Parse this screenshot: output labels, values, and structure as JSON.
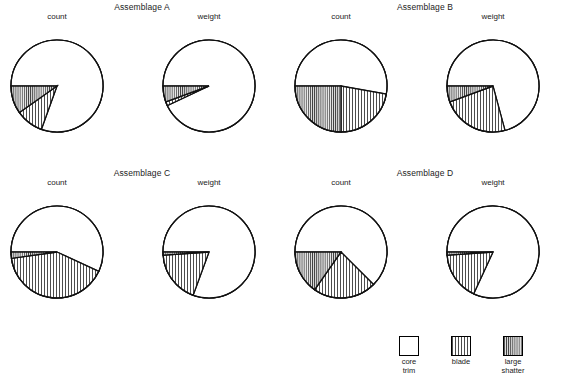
{
  "figure": {
    "background": "#ffffff",
    "stroke_color": "#000000",
    "panels": [
      {
        "title": "Assemblage A",
        "charts": [
          "count",
          "weight"
        ]
      },
      {
        "title": "Assemblage B",
        "charts": [
          "count",
          "weight"
        ]
      },
      {
        "title": "Assemblage C",
        "charts": [
          "count",
          "weight"
        ]
      },
      {
        "title": "Assemblage D",
        "charts": [
          "count",
          "weight"
        ]
      }
    ]
  },
  "legend": {
    "position": "bottom-right",
    "entries": [
      {
        "name": "core-trim",
        "line1": "core",
        "line2": "trim",
        "pattern": "solid-white",
        "fill": "#ffffff"
      },
      {
        "name": "blade",
        "line1": "blade",
        "line2": "",
        "pattern": "vertical-hatch",
        "fill": "#ffffff"
      },
      {
        "name": "large-shatter",
        "line1": "large",
        "line2": "shatter",
        "pattern": "vertical-hatch-dense",
        "fill": "#e8e8e8"
      }
    ]
  },
  "chart_data": [
    {
      "type": "pie",
      "title": "Assemblage A",
      "subtitle": "count",
      "categories": [
        "core trim",
        "blade",
        "large shatter"
      ],
      "values": [
        80.5,
        9.7,
        9.8
      ],
      "unit": "percent",
      "start_angle_deg": 180,
      "direction": "clockwise-over-top",
      "patterns": [
        "solid-white",
        "vertical-hatch",
        "vertical-hatch-dense"
      ]
    },
    {
      "type": "pie",
      "title": "Assemblage A",
      "subtitle": "weight",
      "categories": [
        "core trim",
        "blade",
        "large shatter"
      ],
      "values": [
        93.0,
        1.4,
        5.6
      ],
      "unit": "percent",
      "start_angle_deg": 180,
      "direction": "clockwise-over-top",
      "patterns": [
        "solid-white",
        "vertical-hatch",
        "vertical-hatch-dense"
      ]
    },
    {
      "type": "pie",
      "title": "Assemblage B",
      "subtitle": "count",
      "categories": [
        "core trim",
        "blade",
        "large shatter"
      ],
      "values": [
        52.8,
        22.2,
        25.0
      ],
      "unit": "percent",
      "start_angle_deg": 180,
      "direction": "clockwise-over-top",
      "patterns": [
        "solid-white",
        "vertical-hatch",
        "vertical-hatch-dense"
      ]
    },
    {
      "type": "pie",
      "title": "Assemblage B",
      "subtitle": "weight",
      "categories": [
        "core trim",
        "blade",
        "large shatter"
      ],
      "values": [
        70.8,
        23.6,
        5.6
      ],
      "unit": "percent",
      "start_angle_deg": 180,
      "direction": "clockwise-over-top",
      "patterns": [
        "solid-white",
        "vertical-hatch",
        "vertical-hatch-dense"
      ]
    },
    {
      "type": "pie",
      "title": "Assemblage C",
      "subtitle": "count",
      "categories": [
        "core trim",
        "blade",
        "large shatter"
      ],
      "values": [
        56.9,
        40.9,
        2.2
      ],
      "unit": "percent",
      "start_angle_deg": 180,
      "direction": "clockwise-over-top",
      "patterns": [
        "solid-white",
        "vertical-hatch",
        "vertical-hatch-dense"
      ]
    },
    {
      "type": "pie",
      "title": "Assemblage C",
      "subtitle": "weight",
      "categories": [
        "core trim",
        "blade",
        "large shatter"
      ],
      "values": [
        80.6,
        18.3,
        1.1
      ],
      "unit": "percent",
      "start_angle_deg": 180,
      "direction": "clockwise-over-top",
      "patterns": [
        "solid-white",
        "vertical-hatch",
        "vertical-hatch-dense"
      ]
    },
    {
      "type": "pie",
      "title": "Assemblage D",
      "subtitle": "count",
      "categories": [
        "core trim",
        "blade",
        "large shatter"
      ],
      "values": [
        62.5,
        22.2,
        15.3
      ],
      "unit": "percent",
      "start_angle_deg": 180,
      "direction": "clockwise-over-top",
      "patterns": [
        "solid-white",
        "vertical-hatch",
        "vertical-hatch-dense"
      ]
    },
    {
      "type": "pie",
      "title": "Assemblage D",
      "subtitle": "weight",
      "categories": [
        "core trim",
        "blade",
        "large shatter"
      ],
      "values": [
        81.9,
        17.0,
        1.1
      ],
      "unit": "percent",
      "start_angle_deg": 180,
      "direction": "clockwise-over-top",
      "patterns": [
        "solid-white",
        "vertical-hatch",
        "vertical-hatch-dense"
      ]
    }
  ],
  "layout": {
    "panel_geometry": [
      {
        "left": 0,
        "top": 2,
        "title_top": 0,
        "pies": [
          {
            "cx": 57,
            "cy": 84,
            "r": 46,
            "label_top": 10
          },
          {
            "cx": 209,
            "cy": 84,
            "r": 46,
            "label_top": 10
          }
        ]
      },
      {
        "left": 283,
        "top": 2,
        "title_top": 0,
        "pies": [
          {
            "cx": 58,
            "cy": 84,
            "r": 46,
            "label_top": 10
          },
          {
            "cx": 210,
            "cy": 84,
            "r": 46,
            "label_top": 10
          }
        ]
      },
      {
        "left": 0,
        "top": 168,
        "title_top": 0,
        "pies": [
          {
            "cx": 57,
            "cy": 84,
            "r": 46,
            "label_top": 10
          },
          {
            "cx": 209,
            "cy": 84,
            "r": 46,
            "label_top": 10
          }
        ]
      },
      {
        "left": 283,
        "top": 168,
        "title_top": 0,
        "pies": [
          {
            "cx": 58,
            "cy": 84,
            "r": 46,
            "label_top": 10
          },
          {
            "cx": 210,
            "cy": 84,
            "r": 46,
            "label_top": 10
          }
        ]
      }
    ],
    "legend_entry_left": [
      0,
      52,
      104
    ]
  }
}
